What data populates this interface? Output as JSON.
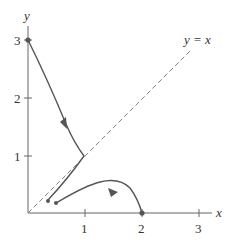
{
  "diagram": {
    "axes": {
      "x_label": "x",
      "y_label": "y",
      "x_ticks": [
        "1",
        "2",
        "3"
      ],
      "y_ticks": [
        "1",
        "2",
        "3"
      ],
      "x_range": [
        0,
        3.3
      ],
      "y_range": [
        0,
        3.3
      ]
    },
    "reference_line": {
      "label": "y = x",
      "style": "dashed",
      "from": [
        0,
        0
      ],
      "to": [
        2.85,
        2.85
      ]
    },
    "curves": [
      {
        "name": "trajectory-from-0-3",
        "start_point": [
          0,
          3
        ],
        "points": [
          [
            0,
            3
          ],
          [
            0.3,
            2.45
          ],
          [
            0.6,
            1.7
          ],
          [
            0.95,
            1.05
          ],
          [
            0.85,
            0.85
          ],
          [
            0.55,
            0.45
          ],
          [
            0.35,
            0.2
          ]
        ],
        "end_point": [
          0.35,
          0.2
        ],
        "arrow_at": [
          0.65,
          1.55
        ],
        "arrow_direction": "up-left"
      },
      {
        "name": "trajectory-to-2-0",
        "start_point": [
          0.48,
          0.18
        ],
        "points": [
          [
            0.48,
            0.18
          ],
          [
            0.8,
            0.42
          ],
          [
            1.2,
            0.56
          ],
          [
            1.45,
            0.42
          ],
          [
            1.75,
            0.18
          ],
          [
            2,
            0
          ]
        ],
        "end_point": [
          2,
          0
        ],
        "arrow_at": [
          1.42,
          0.42
        ],
        "arrow_direction": "down-right"
      }
    ],
    "equilibrium_points": [
      [
        0,
        3
      ],
      [
        2,
        0
      ]
    ]
  }
}
